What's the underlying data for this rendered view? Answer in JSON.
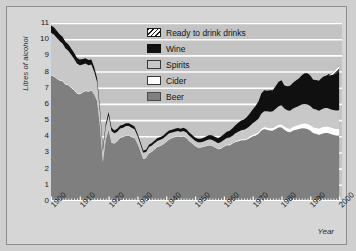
{
  "chart_data": {
    "type": "area",
    "stacked": true,
    "title": "",
    "xlabel": "Year",
    "ylabel": "Litres of alcohol",
    "xlim": [
      1900,
      2001
    ],
    "ylim": [
      0,
      11
    ],
    "yticks": [
      0,
      1,
      2,
      3,
      4,
      5,
      6,
      7,
      8,
      9,
      10,
      11
    ],
    "xticks": [
      1900,
      1910,
      1920,
      1930,
      1940,
      1950,
      1960,
      1970,
      1980,
      1990,
      2000
    ],
    "grid": "horizontal-white-gridlines",
    "legend_position": "top-center",
    "legend_order_top_to_bottom": [
      "Ready to drink drinks",
      "Wine",
      "Spirits",
      "Cider",
      "Beer"
    ],
    "colors": {
      "beer": "#7f7f7f",
      "cider": "#ffffff",
      "spirits": "#c8c8c8",
      "wine": "#101010",
      "ready_to_drink": "#ffffff-hatched",
      "plot_background": "#c3c3c3",
      "gridline": "#ffffff",
      "figure_background": "#d6d6d6"
    },
    "x": [
      1900,
      1901,
      1902,
      1903,
      1904,
      1905,
      1906,
      1907,
      1908,
      1909,
      1910,
      1911,
      1912,
      1913,
      1914,
      1915,
      1916,
      1917,
      1918,
      1919,
      1920,
      1921,
      1922,
      1923,
      1924,
      1925,
      1926,
      1927,
      1928,
      1929,
      1930,
      1931,
      1932,
      1933,
      1934,
      1935,
      1936,
      1937,
      1938,
      1939,
      1940,
      1941,
      1942,
      1943,
      1944,
      1945,
      1946,
      1947,
      1948,
      1949,
      1950,
      1951,
      1952,
      1953,
      1954,
      1955,
      1956,
      1957,
      1958,
      1959,
      1960,
      1961,
      1962,
      1963,
      1964,
      1965,
      1966,
      1967,
      1968,
      1969,
      1970,
      1971,
      1972,
      1973,
      1974,
      1975,
      1976,
      1977,
      1978,
      1979,
      1980,
      1981,
      1982,
      1983,
      1984,
      1985,
      1986,
      1987,
      1988,
      1989,
      1990,
      1991,
      1992,
      1993,
      1994,
      1995,
      1996,
      1997,
      1998,
      1999,
      2000
    ],
    "series": [
      {
        "name": "Beer",
        "values": [
          7.75,
          7.7,
          7.55,
          7.45,
          7.4,
          7.2,
          7.15,
          7.0,
          6.85,
          6.65,
          6.6,
          6.7,
          6.8,
          6.75,
          6.85,
          6.6,
          6.2,
          4.6,
          2.4,
          3.8,
          4.4,
          3.6,
          3.55,
          3.7,
          3.9,
          3.95,
          4.05,
          4.05,
          3.95,
          3.9,
          3.55,
          3.1,
          2.6,
          2.65,
          2.95,
          3.05,
          3.2,
          3.35,
          3.4,
          3.5,
          3.65,
          3.8,
          3.9,
          3.95,
          4.0,
          3.95,
          4.0,
          3.9,
          3.7,
          3.55,
          3.4,
          3.3,
          3.3,
          3.35,
          3.4,
          3.45,
          3.4,
          3.3,
          3.2,
          3.25,
          3.35,
          3.45,
          3.45,
          3.55,
          3.65,
          3.7,
          3.75,
          3.75,
          3.8,
          3.9,
          4.0,
          4.05,
          4.15,
          4.35,
          4.45,
          4.4,
          4.35,
          4.35,
          4.45,
          4.55,
          4.55,
          4.4,
          4.3,
          4.25,
          4.35,
          4.4,
          4.45,
          4.5,
          4.5,
          4.45,
          4.35,
          4.2,
          4.15,
          4.1,
          4.15,
          4.2,
          4.2,
          4.15,
          4.1,
          4.05,
          4.05
        ],
        "description": "Beer consumption, litres of pure alcohol per head"
      },
      {
        "name": "Cider",
        "values": [
          0.04,
          0.04,
          0.04,
          0.04,
          0.04,
          0.04,
          0.04,
          0.04,
          0.04,
          0.04,
          0.04,
          0.04,
          0.04,
          0.04,
          0.04,
          0.04,
          0.04,
          0.04,
          0.03,
          0.03,
          0.03,
          0.03,
          0.03,
          0.03,
          0.03,
          0.03,
          0.03,
          0.03,
          0.03,
          0.03,
          0.03,
          0.03,
          0.03,
          0.03,
          0.03,
          0.03,
          0.03,
          0.03,
          0.03,
          0.03,
          0.03,
          0.03,
          0.03,
          0.03,
          0.03,
          0.03,
          0.03,
          0.03,
          0.03,
          0.03,
          0.03,
          0.03,
          0.03,
          0.03,
          0.03,
          0.03,
          0.03,
          0.03,
          0.03,
          0.04,
          0.04,
          0.04,
          0.05,
          0.05,
          0.05,
          0.06,
          0.06,
          0.07,
          0.07,
          0.08,
          0.09,
          0.1,
          0.1,
          0.12,
          0.13,
          0.14,
          0.15,
          0.16,
          0.17,
          0.18,
          0.2,
          0.2,
          0.21,
          0.22,
          0.24,
          0.25,
          0.26,
          0.28,
          0.3,
          0.32,
          0.34,
          0.36,
          0.38,
          0.38,
          0.4,
          0.4,
          0.4,
          0.4,
          0.4,
          0.4,
          0.4
        ],
        "description": "Cider consumption, thin white band above beer"
      },
      {
        "name": "Spirits",
        "values": [
          2.6,
          2.55,
          2.5,
          2.4,
          2.3,
          2.2,
          2.1,
          2.0,
          1.9,
          1.8,
          1.75,
          1.7,
          1.65,
          1.6,
          1.55,
          1.35,
          1.1,
          0.85,
          0.65,
          0.75,
          0.85,
          0.7,
          0.6,
          0.55,
          0.55,
          0.55,
          0.55,
          0.55,
          0.55,
          0.5,
          0.45,
          0.4,
          0.35,
          0.35,
          0.35,
          0.35,
          0.35,
          0.35,
          0.35,
          0.35,
          0.35,
          0.35,
          0.3,
          0.3,
          0.3,
          0.3,
          0.3,
          0.3,
          0.3,
          0.3,
          0.3,
          0.3,
          0.3,
          0.3,
          0.32,
          0.34,
          0.34,
          0.34,
          0.34,
          0.36,
          0.38,
          0.4,
          0.42,
          0.44,
          0.48,
          0.52,
          0.56,
          0.58,
          0.62,
          0.66,
          0.72,
          0.78,
          0.84,
          0.92,
          0.96,
          1.0,
          1.02,
          1.04,
          1.08,
          1.12,
          1.16,
          1.12,
          1.1,
          1.1,
          1.12,
          1.14,
          1.16,
          1.18,
          1.2,
          1.2,
          1.18,
          1.14,
          1.12,
          1.1,
          1.12,
          1.14,
          1.14,
          1.12,
          1.12,
          1.14,
          1.16
        ],
        "description": "Spirits consumption, light grey band"
      },
      {
        "name": "Wine",
        "values": [
          0.45,
          0.44,
          0.43,
          0.42,
          0.41,
          0.4,
          0.39,
          0.38,
          0.37,
          0.36,
          0.35,
          0.34,
          0.33,
          0.32,
          0.3,
          0.28,
          0.26,
          0.22,
          0.18,
          0.2,
          0.22,
          0.2,
          0.18,
          0.18,
          0.18,
          0.18,
          0.18,
          0.18,
          0.18,
          0.17,
          0.16,
          0.15,
          0.14,
          0.14,
          0.15,
          0.15,
          0.16,
          0.16,
          0.17,
          0.17,
          0.18,
          0.18,
          0.18,
          0.18,
          0.18,
          0.18,
          0.2,
          0.2,
          0.2,
          0.2,
          0.2,
          0.21,
          0.22,
          0.23,
          0.25,
          0.26,
          0.28,
          0.29,
          0.31,
          0.33,
          0.36,
          0.39,
          0.42,
          0.46,
          0.5,
          0.55,
          0.6,
          0.64,
          0.7,
          0.76,
          0.84,
          0.94,
          1.06,
          1.25,
          1.3,
          1.28,
          1.32,
          1.3,
          1.4,
          1.52,
          1.55,
          1.42,
          1.48,
          1.55,
          1.6,
          1.65,
          1.7,
          1.8,
          1.9,
          1.92,
          1.88,
          1.8,
          1.82,
          1.85,
          1.95,
          2.0,
          2.05,
          2.1,
          2.2,
          2.3,
          2.45
        ],
        "description": "Wine consumption, black band on top"
      },
      {
        "name": "Ready to drink drinks",
        "values": [
          0,
          0,
          0,
          0,
          0,
          0,
          0,
          0,
          0,
          0,
          0,
          0,
          0,
          0,
          0,
          0,
          0,
          0,
          0,
          0,
          0,
          0,
          0,
          0,
          0,
          0,
          0,
          0,
          0,
          0,
          0,
          0,
          0,
          0,
          0,
          0,
          0,
          0,
          0,
          0,
          0,
          0,
          0,
          0,
          0,
          0,
          0,
          0,
          0,
          0,
          0,
          0,
          0,
          0,
          0,
          0,
          0,
          0,
          0,
          0,
          0,
          0,
          0,
          0,
          0,
          0,
          0,
          0,
          0,
          0,
          0,
          0,
          0,
          0,
          0,
          0,
          0,
          0,
          0,
          0,
          0,
          0,
          0,
          0,
          0,
          0,
          0,
          0,
          0,
          0,
          0,
          0,
          0,
          0,
          0,
          0.02,
          0.05,
          0.1,
          0.18,
          0.26,
          0.34
        ],
        "description": "Ready to drink drinks (alcopops), hatched band, appears only from the late 1990s"
      }
    ],
    "totals": [
      10.84,
      10.73,
      10.52,
      10.31,
      10.15,
      9.84,
      9.68,
      9.42,
      9.16,
      8.85,
      8.74,
      8.78,
      8.82,
      8.71,
      8.74,
      8.27,
      7.6,
      5.71,
      3.26,
      4.78,
      5.5,
      4.53,
      4.36,
      4.46,
      4.66,
      4.71,
      4.81,
      4.81,
      4.71,
      4.6,
      4.19,
      3.68,
      3.12,
      3.17,
      3.48,
      3.58,
      3.74,
      3.89,
      3.95,
      4.05,
      4.21,
      4.36,
      4.41,
      4.46,
      4.51,
      4.46,
      4.53,
      4.43,
      4.23,
      4.08,
      3.93,
      3.84,
      3.85,
      3.91,
      4.0,
      4.08,
      4.05,
      3.96,
      3.88,
      3.98,
      4.13,
      4.28,
      4.34,
      4.5,
      4.68,
      4.83,
      4.97,
      5.04,
      5.19,
      5.4,
      5.65,
      5.87,
      6.15,
      6.64,
      6.84,
      6.82,
      6.84,
      6.85,
      7.1,
      7.37,
      7.46,
      7.14,
      7.09,
      7.12,
      7.31,
      7.44,
      7.57,
      7.76,
      7.9,
      7.89,
      7.75,
      7.5,
      7.47,
      7.43,
      7.62,
      7.76,
      7.81,
      7.82,
      7.92,
      8.07,
      8.4
    ]
  },
  "legend": {
    "items": [
      {
        "label": "Ready to drink drinks",
        "swatch": "hatched-swatch"
      },
      {
        "label": "Wine",
        "swatch": "black-swatch"
      },
      {
        "label": "Spirits",
        "swatch": "light-grey-swatch"
      },
      {
        "label": "Cider",
        "swatch": "white-swatch"
      },
      {
        "label": "Beer",
        "swatch": "grey-swatch"
      }
    ]
  },
  "axes": {
    "y_title": "Litres of alcohol",
    "x_title": "Year",
    "y_tick_labels": [
      "11",
      "10",
      "9",
      "8",
      "7",
      "6",
      "5",
      "4",
      "3",
      "2",
      "1",
      "0"
    ],
    "x_tick_labels": [
      "1900",
      "1910",
      "1920",
      "1930",
      "1940",
      "1950",
      "1960",
      "1970",
      "1980",
      "1990",
      "2000"
    ]
  }
}
